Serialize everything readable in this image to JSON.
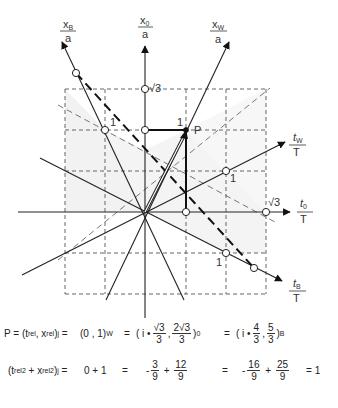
{
  "diagram": {
    "axes": {
      "x_B": {
        "label_top": "x",
        "label_sub": "B",
        "label_bottom": "a"
      },
      "x_0": {
        "label_top": "x",
        "label_sub": "0",
        "label_bottom": "a"
      },
      "x_W": {
        "label_top": "x",
        "label_sub": "W",
        "label_bottom": "a"
      },
      "t_W": {
        "label_top": "t",
        "label_sub": "W",
        "label_bottom": "T"
      },
      "t_0": {
        "label_top": "t",
        "label_sub": "0",
        "label_bottom": "T"
      },
      "t_B": {
        "label_top": "t",
        "label_sub": "B",
        "label_bottom": "T"
      }
    },
    "tick_labels": {
      "sqrt3_x0": "√3",
      "sqrt3_t0": "√3",
      "one_xB": "1",
      "one_xW": "1",
      "one_tW": "1",
      "one_tB": "1"
    },
    "point_label": "P"
  },
  "formulas": {
    "line1": {
      "lhs": "P = (t",
      "lhs_sub1": "rel",
      "lhs_mid": ", x",
      "lhs_sub2": "rel",
      "lhs_end": ")",
      "lhs_sub3": "j",
      "eq1": "=",
      "w_value": "(0 , 1)",
      "w_sub": "W",
      "eq2": "=",
      "o_open": "( i •",
      "o_frac1_num": "√3",
      "o_frac1_den": "3",
      "o_comma": ",",
      "o_frac2_num": "2√3",
      "o_frac2_den": "3",
      "o_close": ")",
      "o_sub": "0",
      "eq3": "=",
      "b_open": "( i •",
      "b_frac1_num": "4",
      "b_frac1_den": "3",
      "b_comma": ",",
      "b_frac2_num": "5",
      "b_frac2_den": "3",
      "b_close": ")",
      "b_sub": "B"
    },
    "line2": {
      "lhs_open": "(t",
      "lhs_sub1": "rel",
      "lhs_sup1": "2",
      "lhs_plus": "+ x",
      "lhs_sub2": "rel",
      "lhs_sup2": "2",
      "lhs_close": ")",
      "lhs_sub3": "j",
      "eq1": "=",
      "w_value": "0 + 1",
      "eq2": "=",
      "o_minus": "-",
      "o_frac1_num": "3",
      "o_frac1_den": "9",
      "o_plus": "+",
      "o_frac2_num": "12",
      "o_frac2_den": "9",
      "eq3": "=",
      "b_minus": "-",
      "b_frac1_num": "16",
      "b_frac1_den": "9",
      "b_plus": "+",
      "b_frac2_num": "25",
      "b_frac2_den": "9",
      "eq4": "=",
      "result": "1"
    }
  }
}
